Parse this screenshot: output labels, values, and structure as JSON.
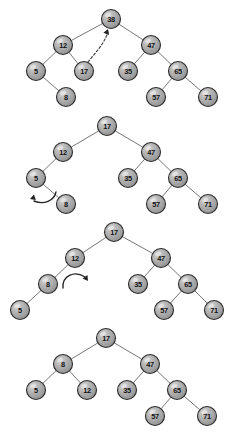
{
  "figure": {
    "title": "",
    "background_color": "#ffffff",
    "node_fill_color": "#a8a8a8",
    "node_stroke_color": "#2e2e2e",
    "edge_color": "#5d5d5d",
    "arrow_color": "#232323",
    "node_radius": 9.5,
    "width": 232,
    "height": 437
  },
  "chart_data": {
    "type": "diagram",
    "diagram_kind": "binary-search-tree-rotation-sequence",
    "panel_count": 4,
    "panels": [
      {
        "index": 0,
        "caption": "",
        "root": "38",
        "nodes": [
          {
            "id": "n1_38",
            "label": "38",
            "x": 111,
            "y": 19
          },
          {
            "id": "n1_12",
            "label": "12",
            "x": 63,
            "y": 45
          },
          {
            "id": "n1_47",
            "label": "47",
            "x": 151,
            "y": 45
          },
          {
            "id": "n1_5",
            "label": "5",
            "x": 36,
            "y": 71
          },
          {
            "id": "n1_17",
            "label": "17",
            "x": 84,
            "y": 71
          },
          {
            "id": "n1_35",
            "label": "35",
            "x": 128,
            "y": 71
          },
          {
            "id": "n1_65",
            "label": "65",
            "x": 178,
            "y": 71
          },
          {
            "id": "n1_8",
            "label": "8",
            "x": 66,
            "y": 97
          },
          {
            "id": "n1_57",
            "label": "57",
            "x": 156,
            "y": 97
          },
          {
            "id": "n1_71",
            "label": "71",
            "x": 208,
            "y": 97
          }
        ],
        "edges": [
          [
            "n1_38",
            "n1_12"
          ],
          [
            "n1_38",
            "n1_47"
          ],
          [
            "n1_12",
            "n1_5"
          ],
          [
            "n1_12",
            "n1_17"
          ],
          [
            "n1_47",
            "n1_35"
          ],
          [
            "n1_47",
            "n1_65"
          ],
          [
            "n1_5",
            "n1_8"
          ],
          [
            "n1_65",
            "n1_57"
          ],
          [
            "n1_65",
            "n1_71"
          ]
        ],
        "annotations": [
          {
            "kind": "dashed-arrow",
            "name": "promote-17-to-root-arrow",
            "from": "n1_17",
            "to": "n1_38",
            "path": "M 88 62 C 96 52 104 44 108 32",
            "head_x": 108,
            "head_y": 29,
            "head_angle": -70
          }
        ]
      },
      {
        "index": 1,
        "caption": "",
        "root": "17",
        "nodes": [
          {
            "id": "n2_17",
            "label": "17",
            "x": 107,
            "y": 126
          },
          {
            "id": "n2_12",
            "label": "12",
            "x": 63,
            "y": 152
          },
          {
            "id": "n2_47",
            "label": "47",
            "x": 151,
            "y": 152
          },
          {
            "id": "n2_5",
            "label": "5",
            "x": 36,
            "y": 178
          },
          {
            "id": "n2_35",
            "label": "35",
            "x": 128,
            "y": 178
          },
          {
            "id": "n2_65",
            "label": "65",
            "x": 178,
            "y": 178
          },
          {
            "id": "n2_8",
            "label": "8",
            "x": 66,
            "y": 204
          },
          {
            "id": "n2_57",
            "label": "57",
            "x": 156,
            "y": 204
          },
          {
            "id": "n2_71",
            "label": "71",
            "x": 208,
            "y": 204
          }
        ],
        "edges": [
          [
            "n2_17",
            "n2_12"
          ],
          [
            "n2_17",
            "n2_47"
          ],
          [
            "n2_12",
            "n2_5"
          ],
          [
            "n2_5",
            "n2_8"
          ],
          [
            "n2_47",
            "n2_35"
          ],
          [
            "n2_47",
            "n2_65"
          ],
          [
            "n2_65",
            "n2_57"
          ],
          [
            "n2_65",
            "n2_71"
          ]
        ],
        "annotations": [
          {
            "kind": "rotation-arrow",
            "name": "left-rotation-at-5-arrow",
            "direction": "counterclockwise",
            "path": "M 56 192 C 54 201 44 205 34 201",
            "head_x": 30,
            "head_y": 199,
            "head_angle": 160
          }
        ]
      },
      {
        "index": 2,
        "caption": "",
        "root": "17",
        "nodes": [
          {
            "id": "n3_17",
            "label": "17",
            "x": 114,
            "y": 232
          },
          {
            "id": "n3_12",
            "label": "12",
            "x": 75,
            "y": 258
          },
          {
            "id": "n3_47",
            "label": "47",
            "x": 161,
            "y": 258
          },
          {
            "id": "n3_8",
            "label": "8",
            "x": 48,
            "y": 284
          },
          {
            "id": "n3_35",
            "label": "35",
            "x": 138,
            "y": 284
          },
          {
            "id": "n3_65",
            "label": "65",
            "x": 188,
            "y": 284
          },
          {
            "id": "n3_5",
            "label": "5",
            "x": 20,
            "y": 310
          },
          {
            "id": "n3_57",
            "label": "57",
            "x": 164,
            "y": 310
          },
          {
            "id": "n3_71",
            "label": "71",
            "x": 214,
            "y": 310
          }
        ],
        "edges": [
          [
            "n3_17",
            "n3_12"
          ],
          [
            "n3_17",
            "n3_47"
          ],
          [
            "n3_12",
            "n3_8"
          ],
          [
            "n3_8",
            "n3_5"
          ],
          [
            "n3_47",
            "n3_35"
          ],
          [
            "n3_47",
            "n3_65"
          ],
          [
            "n3_65",
            "n3_57"
          ],
          [
            "n3_65",
            "n3_71"
          ]
        ],
        "annotations": [
          {
            "kind": "rotation-arrow",
            "name": "right-rotation-at-12-arrow",
            "direction": "clockwise",
            "path": "M 63 288 C 62 276 74 270 85 277",
            "head_x": 88,
            "head_y": 281,
            "head_angle": 55
          }
        ]
      },
      {
        "index": 3,
        "caption": "",
        "root": "17",
        "nodes": [
          {
            "id": "n4_17",
            "label": "17",
            "x": 106,
            "y": 338
          },
          {
            "id": "n4_8",
            "label": "8",
            "x": 63,
            "y": 364
          },
          {
            "id": "n4_47",
            "label": "47",
            "x": 150,
            "y": 364
          },
          {
            "id": "n4_5",
            "label": "5",
            "x": 36,
            "y": 390
          },
          {
            "id": "n4_12",
            "label": "12",
            "x": 87,
            "y": 390
          },
          {
            "id": "n4_35",
            "label": "35",
            "x": 127,
            "y": 390
          },
          {
            "id": "n4_65",
            "label": "65",
            "x": 177,
            "y": 390
          },
          {
            "id": "n4_57",
            "label": "57",
            "x": 155,
            "y": 416
          },
          {
            "id": "n4_71",
            "label": "71",
            "x": 207,
            "y": 416
          }
        ],
        "edges": [
          [
            "n4_17",
            "n4_8"
          ],
          [
            "n4_17",
            "n4_47"
          ],
          [
            "n4_8",
            "n4_5"
          ],
          [
            "n4_8",
            "n4_12"
          ],
          [
            "n4_47",
            "n4_35"
          ],
          [
            "n4_47",
            "n4_65"
          ],
          [
            "n4_65",
            "n4_57"
          ],
          [
            "n4_65",
            "n4_71"
          ]
        ],
        "annotations": []
      }
    ]
  }
}
